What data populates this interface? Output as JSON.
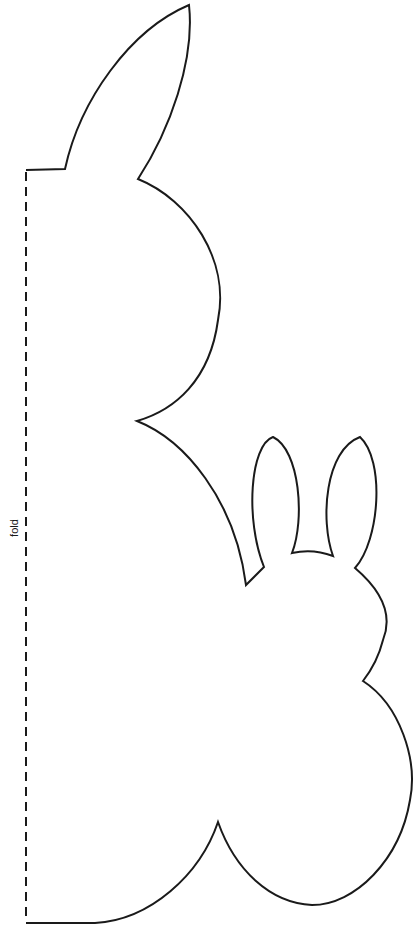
{
  "page": {
    "background": "#ffffff",
    "line_color": "#1a1a1a"
  },
  "template": {
    "subject": "rabbit cut-out template (large and small rabbit outline)",
    "fold_label": "fold",
    "fold_line_style": "dashed"
  }
}
